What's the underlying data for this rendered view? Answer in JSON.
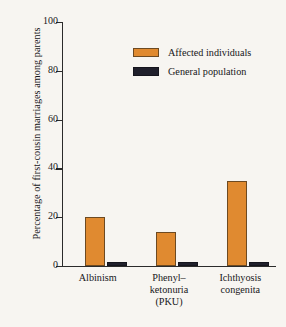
{
  "chart_data": {
    "type": "bar",
    "title": "",
    "xlabel": "",
    "ylabel": "Percentage of first-cousin marriages among parents",
    "ylim": [
      0,
      100
    ],
    "yticks": [
      0,
      20,
      40,
      60,
      80,
      100
    ],
    "ytick_labels": [
      "0",
      "20",
      "40",
      "60",
      "80",
      "100"
    ],
    "grid": false,
    "legend_position": "top-right",
    "categories": [
      "Albinism",
      "Phenyl–ketonuria (PKU)",
      "Ichthyosis congenita"
    ],
    "category_lines": [
      [
        "Albinism"
      ],
      [
        "Phenyl–",
        "ketonuria",
        "(PKU)"
      ],
      [
        "Ichthyosis",
        "congenita"
      ]
    ],
    "series": [
      {
        "name": "Affected individuals",
        "color": "#e08a30",
        "values": [
          20,
          14,
          35
        ]
      },
      {
        "name": "General population",
        "color": "#20202c",
        "values": [
          1.6,
          1.6,
          1.8
        ]
      }
    ]
  },
  "legend": {
    "items": [
      {
        "label": "Affected individuals",
        "swatch": "affected"
      },
      {
        "label": "General population",
        "swatch": "general"
      }
    ]
  }
}
